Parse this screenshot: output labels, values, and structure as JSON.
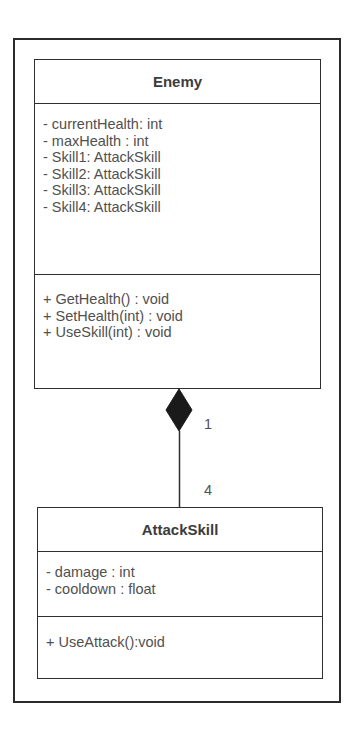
{
  "diagram": {
    "type": "UML class diagram",
    "classes": [
      {
        "name": "Enemy",
        "attributes": [
          "- currentHealth: int",
          "- maxHealth : int",
          "- Skill1: AttackSkill",
          "- Skill2: AttackSkill",
          "- Skill3: AttackSkill",
          "- Skill4: AttackSkill"
        ],
        "methods": [
          "+ GetHealth() : void",
          "+ SetHealth(int) : void",
          "+ UseSkill(int) : void"
        ]
      },
      {
        "name": "AttackSkill",
        "attributes": [
          "- damage : int",
          "- cooldown : float"
        ],
        "methods": [
          "+ UseAttack():void"
        ]
      }
    ],
    "relationship": {
      "type": "composition",
      "from": "Enemy",
      "to": "AttackSkill",
      "multiplicity_whole": "1",
      "multiplicity_part": "4"
    }
  }
}
